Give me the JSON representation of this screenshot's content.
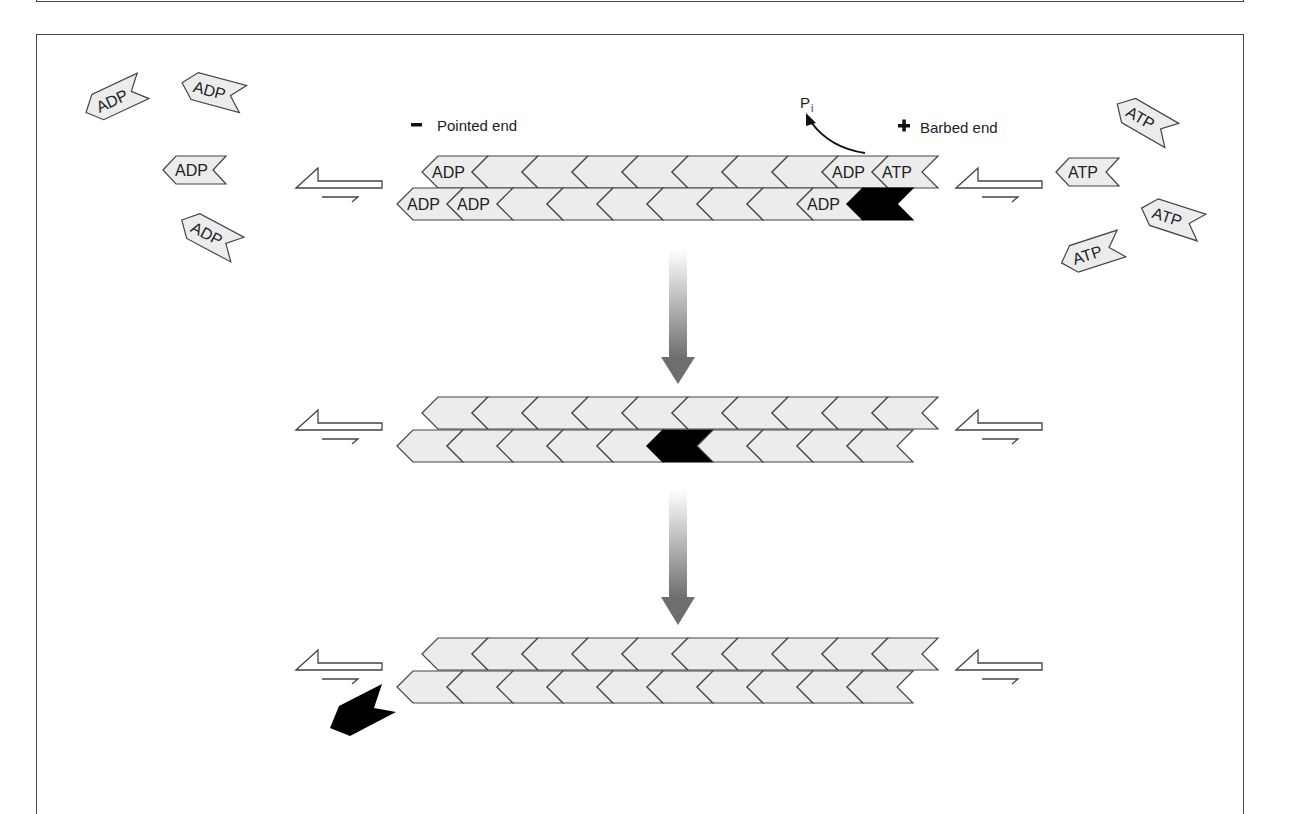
{
  "figure": {
    "labels": {
      "pointed_end_sign": "−",
      "pointed_end": "Pointed end",
      "barbed_end_sign": "+",
      "barbed_end": "Barbed end",
      "phosphate": "P",
      "phosphate_subscript": "i"
    },
    "free_monomers_left": [
      {
        "label": "ADP",
        "x": 115,
        "y": 99,
        "rotate": -25
      },
      {
        "label": "ADP",
        "x": 213,
        "y": 91,
        "rotate": 15
      },
      {
        "label": "ADP",
        "x": 195,
        "y": 170,
        "rotate": 0
      },
      {
        "label": "ADP",
        "x": 210,
        "y": 235,
        "rotate": 28
      }
    ],
    "free_monomers_right": [
      {
        "label": "ATP",
        "x": 1145,
        "y": 120,
        "rotate": 30
      },
      {
        "label": "ATP",
        "x": 1088,
        "y": 172,
        "rotate": 0
      },
      {
        "label": "ATP",
        "x": 1172,
        "y": 218,
        "rotate": 18
      },
      {
        "label": "ATP",
        "x": 1092,
        "y": 253,
        "rotate": -18
      }
    ],
    "filaments": [
      {
        "name": "filament-1",
        "top_row_y": 156,
        "bottom_row_y": 188,
        "top_row": [
          "ADP",
          "",
          "",
          "",
          "",
          "",
          "",
          "",
          "ADP",
          "ATP"
        ],
        "bottom_row": [
          "ADP",
          "ADP",
          "",
          "",
          "",
          "",
          "",
          "",
          "ADP",
          ""
        ],
        "black_bottom_index": 9
      },
      {
        "name": "filament-2",
        "top_row_y": 397,
        "bottom_row_y": 430,
        "top_row": [
          "",
          "",
          "",
          "",
          "",
          "",
          "",
          "",
          "",
          ""
        ],
        "bottom_row": [
          "",
          "",
          "",
          "",
          "",
          "",
          "",
          "",
          "",
          ""
        ],
        "black_bottom_index": 5
      },
      {
        "name": "filament-3",
        "top_row_y": 638,
        "bottom_row_y": 671,
        "top_row": [
          "",
          "",
          "",
          "",
          "",
          "",
          "",
          "",
          "",
          ""
        ],
        "bottom_row": [
          "",
          "",
          "",
          "",
          "",
          "",
          "",
          "",
          "",
          ""
        ],
        "black_bottom_index": -1
      }
    ],
    "colors": {
      "subunit_fill": "#ececec",
      "subunit_stroke": "#444444",
      "black_subunit": "#000000",
      "arrow_gradient_start": "#ffffff",
      "arrow_gradient_end": "#6e6e6e"
    }
  }
}
